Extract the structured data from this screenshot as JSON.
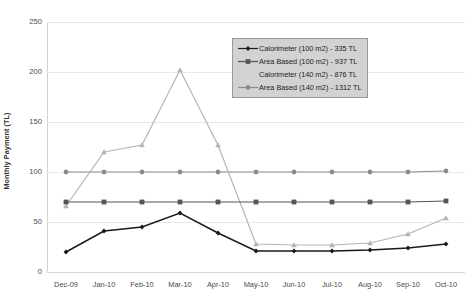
{
  "chart_data": {
    "type": "line",
    "title": "",
    "xlabel": "",
    "ylabel": "Monthly Payment (TL)",
    "ylim": [
      0,
      250
    ],
    "yticks": [
      0,
      50,
      100,
      150,
      200,
      250
    ],
    "grid": true,
    "legend_position": "upper-right-inside",
    "categories": [
      "Dec-09",
      "Jan-10",
      "Feb-10",
      "Mar-10",
      "Apr-10",
      "May-10",
      "Jun-10",
      "Jul-10",
      "Aug-10",
      "Sep-10",
      "Oct-10"
    ],
    "series": [
      {
        "name": "Calorimeter (100 m2) - 335 TL",
        "marker": "diamond",
        "color": "#1a1a1a",
        "values": [
          20,
          41,
          45,
          59,
          39,
          21,
          21,
          21,
          22,
          24,
          28
        ]
      },
      {
        "name": "Area Based (100 m2) - 937 TL",
        "marker": "square",
        "color": "#555555",
        "values": [
          70,
          70,
          70,
          70,
          70,
          70,
          70,
          70,
          70,
          70,
          71
        ]
      },
      {
        "name": "Calorimeter (140 m2) - 876 TL",
        "marker": "triangle",
        "color": "#b4b4b4",
        "values": [
          66,
          120,
          127,
          202,
          127,
          28,
          27,
          27,
          29,
          38,
          54
        ]
      },
      {
        "name": "Area Based (140 m2) - 1312 TL",
        "marker": "circle",
        "color": "#8d8d8d",
        "values": [
          100,
          100,
          100,
          100,
          100,
          100,
          100,
          100,
          100,
          100,
          101
        ]
      }
    ]
  },
  "legend": {
    "items": [
      {
        "label": "Calorimeter (100 m2) - 335 TL",
        "marker": "diamond",
        "color": "#1a1a1a",
        "show_marker": true
      },
      {
        "label": "Area Based (100 m2) - 937 TL",
        "marker": "square",
        "color": "#555555",
        "show_marker": true
      },
      {
        "label": "Calorimeter (140 m2) - 876 TL",
        "marker": "triangle",
        "color": "#c9c9c9",
        "show_marker": false
      },
      {
        "label": "Area Based (140 m2) - 1312 TL",
        "marker": "circle",
        "color": "#8d8d8d",
        "show_marker": true
      }
    ]
  }
}
